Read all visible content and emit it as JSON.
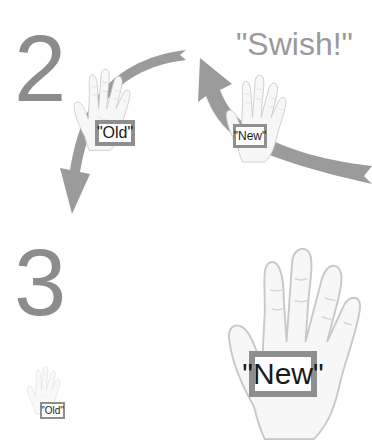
{
  "steps": [
    {
      "number": "2",
      "caption": "\"Swish!\"",
      "old_label": "\"Old\"",
      "new_label": "\"New\""
    },
    {
      "number": "3",
      "old_label": "\"Old\"",
      "new_label": "\"New\""
    }
  ],
  "colors": {
    "number_gray": "#8c8c8c",
    "caption_gray": "#9a9a9a",
    "arrow_gray": "#9b9b9b",
    "box_border_gray": "#8f8f8f",
    "hand_fill": "#f7f7f7",
    "hand_outline": "#c8c8c8"
  },
  "icons": {
    "hand": "open-hand-icon",
    "arrow_up": "curved-arrow-up-left-icon",
    "arrow_down": "curved-arrow-down-left-icon"
  }
}
